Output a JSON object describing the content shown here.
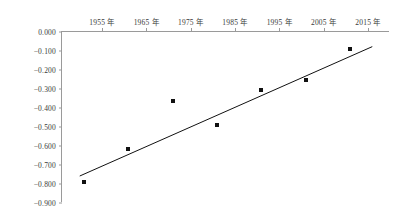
{
  "chart_data": {
    "type": "scatter",
    "title": "",
    "subtitle": "",
    "xlabel": "",
    "ylabel": "",
    "xlim": [
      1946,
      2020
    ],
    "ylim": [
      -0.9,
      0.0
    ],
    "grid": false,
    "legend": null,
    "x_tick_labels": [
      "1955 年",
      "1965 年",
      "1975 年",
      "1985 年",
      "1995 年",
      "2005 年",
      "2015 年"
    ],
    "x_tick_values": [
      1955,
      1965,
      1975,
      1985,
      1995,
      2005,
      2015
    ],
    "y_tick_labels": [
      "0.000",
      "-0.100",
      "-0.200",
      "-0.300",
      "-0.400",
      "-0.500",
      "-0.600",
      "-0.700",
      "-0.800",
      "-0.900"
    ],
    "y_tick_values": [
      0.0,
      -0.1,
      -0.2,
      -0.3,
      -0.4,
      -0.5,
      -0.6,
      -0.7,
      -0.8,
      -0.9
    ],
    "x": [
      1951,
      1961,
      1971,
      1981,
      1991,
      2001,
      2011
    ],
    "values": [
      -0.79,
      -0.615,
      -0.365,
      -0.49,
      -0.305,
      -0.25,
      -0.09
    ],
    "series": [
      {
        "name": "観測値",
        "x": [
          1951,
          1961,
          1971,
          1981,
          1991,
          2001,
          2011
        ],
        "values": [
          -0.79,
          -0.615,
          -0.365,
          -0.49,
          -0.305,
          -0.25,
          -0.09
        ],
        "marker": "square",
        "color": "#111111"
      },
      {
        "name": "回帰直線",
        "type": "line",
        "x": [
          1950,
          2016
        ],
        "values": [
          -0.758,
          -0.077
        ],
        "color": "#111111"
      }
    ],
    "axis_color": "#9a9a9a",
    "tick_label_color": "#3a3a3a",
    "background": "#ffffff"
  }
}
